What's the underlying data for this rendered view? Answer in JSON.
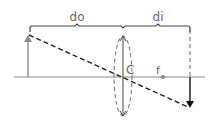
{
  "diagram": {
    "type": "thin-lens-ray-diagram",
    "labels": {
      "object_distance": "do",
      "image_distance": "di",
      "center": "C",
      "focal_point": "f"
    },
    "colors": {
      "axis": "#8a8a8a",
      "object_arrow": "#8a8a8a",
      "image_arrow": "#111111",
      "ray": "#222222",
      "lens": "#555555",
      "bracket": "#444444"
    }
  }
}
